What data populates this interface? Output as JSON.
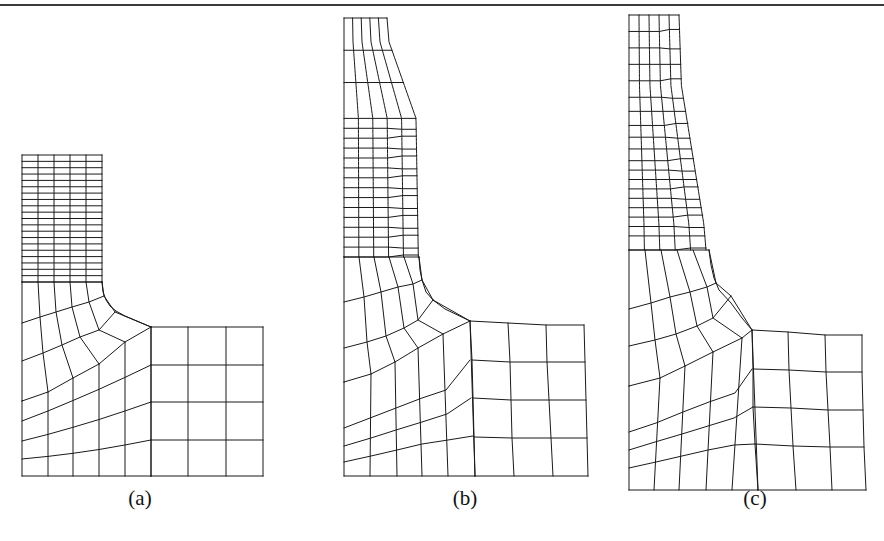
{
  "figure": {
    "rule_color": "#3a3a3a",
    "line_color": "#1a1a1a",
    "panels": [
      {
        "id": "a",
        "caption": "(a)",
        "caption_pos": [
          140,
          500
        ],
        "description": "Undeformed mesh",
        "neck": {
          "xs": [
            22,
            38,
            54,
            70,
            86,
            102
          ],
          "top": 155,
          "bottom": 282,
          "rows": 20,
          "bottom_xs": [
            22,
            38,
            54,
            70,
            86,
            102
          ]
        },
        "transition": {
          "rows": [
            [
              [
                22,
                282
              ],
              [
                38,
                282
              ],
              [
                54,
                282
              ],
              [
                70,
                282
              ],
              [
                86,
                282
              ],
              [
                102,
                282
              ]
            ],
            [
              [
                22,
                322
              ],
              [
                40,
                317
              ],
              [
                57,
                311
              ],
              [
                75,
                306
              ],
              [
                93,
                300
              ],
              [
                104,
                295
              ]
            ],
            [
              [
                22,
                360
              ],
              [
                42,
                352
              ],
              [
                62,
                344
              ],
              [
                79,
                336
              ],
              [
                97,
                328
              ],
              [
                117,
                312
              ]
            ],
            [
              [
                22,
                403
              ],
              [
                48,
                392
              ],
              [
                68,
                376
              ],
              [
                99,
                350
              ],
              [
                125,
                339
              ],
              [
                151,
                327
              ]
            ]
          ]
        },
        "fan": {
          "cols_x": [
            22,
            48,
            73,
            99,
            125,
            151
          ],
          "rows_left_y": [
            403,
            422,
            441,
            459,
            476
          ],
          "rows_right_y": [
            365,
            402,
            440,
            476
          ],
          "bottom": 476
        },
        "flange": {
          "xs": [
            151,
            188,
            226,
            263
          ],
          "ys": [
            327,
            365,
            402,
            440,
            476
          ]
        }
      },
      {
        "id": "b",
        "caption": "(b)",
        "caption_pos": [
          465,
          500
        ],
        "description": "Deformed mesh, method 1",
        "caption_text_pos": "center"
      },
      {
        "id": "c",
        "caption": "(c)",
        "caption_pos": [
          755,
          500
        ],
        "description": "Deformed mesh, method 2"
      }
    ]
  }
}
